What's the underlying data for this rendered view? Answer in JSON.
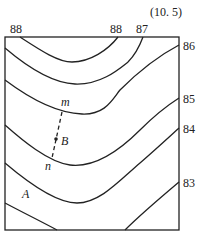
{
  "figure": {
    "number": "(10. 5)",
    "type": "contour map",
    "top_labels": [
      "88",
      "88",
      "87"
    ],
    "right_labels": [
      "86",
      "85",
      "84",
      "83"
    ],
    "points": {
      "m": "m",
      "n": "n",
      "B": "B",
      "A": "A"
    },
    "contour_values": [
      88,
      87,
      86,
      85,
      84,
      83
    ]
  }
}
